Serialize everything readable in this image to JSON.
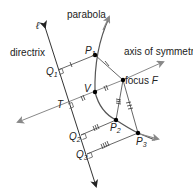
{
  "labels": {
    "parabola": "parabola",
    "directrix": "directrix",
    "axis": "axis of symmetry",
    "focus": "focus ",
    "focus_letter": "F",
    "line": "ℓ",
    "P1": "P",
    "P1_sub": "1",
    "P2": "P",
    "P2_sub": "2",
    "P3": "P",
    "P3_sub": "3",
    "V": "V",
    "T": "T",
    "Q1": "Q",
    "Q1_sub": "1",
    "Q2": "Q",
    "Q2_sub": "2",
    "Q3": "Q",
    "Q3_sub": "3"
  },
  "colors": {
    "line": "#333333",
    "axis": "#888888",
    "point": "#000000"
  }
}
